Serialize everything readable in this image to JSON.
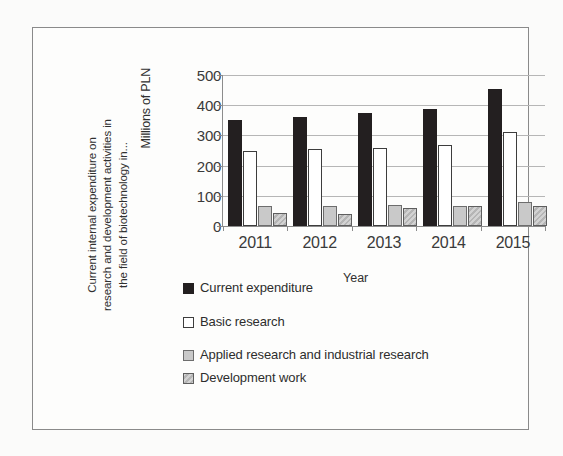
{
  "chart_data": {
    "type": "bar",
    "title": "Current internal expenditure on research and development activities in the field of biotechnology in...",
    "title_lines": [
      "Current internal expenditure on",
      "research and development activities in",
      "the field of biotechnology in..."
    ],
    "xlabel": "Year",
    "ylabel": "Millions of PLN",
    "categories": [
      "2011",
      "2012",
      "2013",
      "2014",
      "2015"
    ],
    "ylim": [
      0,
      500
    ],
    "yticks": [
      500,
      400,
      300,
      200,
      100,
      0
    ],
    "grid": true,
    "legend_position": "below-plot-left",
    "series": [
      {
        "name": "Current expenditure",
        "color": "#231f20",
        "fill": "solid-black",
        "values": [
          350,
          362,
          374,
          387,
          454
        ]
      },
      {
        "name": "Basic research",
        "color": "#ffffff",
        "fill": "white-outline",
        "values": [
          247,
          254,
          257,
          268,
          310
        ]
      },
      {
        "name": "Applied research and industrial research",
        "color": "#c9c9c9",
        "fill": "light-gray",
        "values": [
          65,
          67,
          70,
          67,
          78
        ]
      },
      {
        "name": "Development work",
        "color": "#b5b5b5",
        "fill": "hatched-gray",
        "values": [
          44,
          41,
          60,
          67,
          65
        ]
      }
    ]
  }
}
